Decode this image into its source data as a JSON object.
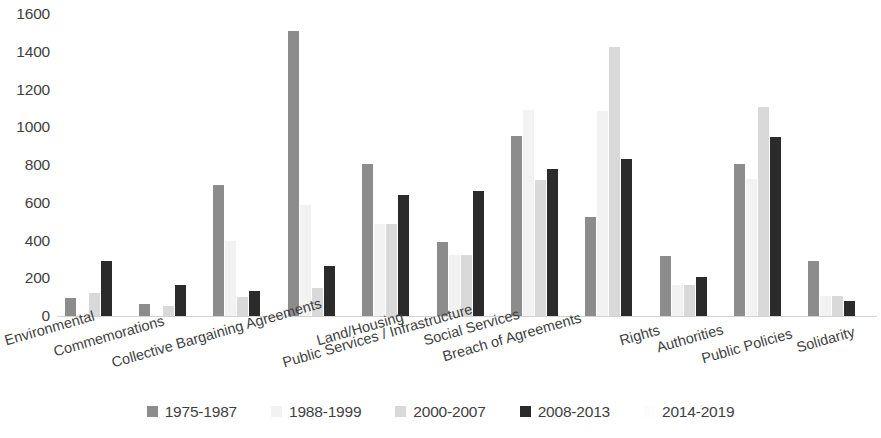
{
  "chart_data": {
    "type": "bar",
    "title": "",
    "subtitle": "",
    "xlabel": "",
    "ylabel": "",
    "ylim": [
      0,
      1600
    ],
    "y_ticks": [
      0,
      200,
      400,
      600,
      800,
      1000,
      1200,
      1400,
      1600
    ],
    "grid": false,
    "legend_position": "bottom",
    "categories": [
      "Environmental",
      "Commemorations",
      "Collective Bargaining Agreements",
      "Land/Housing",
      "Public Services / Infrastructure",
      "Social Services",
      "Breach of Agreements",
      "Rights",
      "Authorities",
      "Public Policies",
      "Solidarity"
    ],
    "series": [
      {
        "name": "1975-1987",
        "color": "#8c8c8c",
        "values": [
          95,
          65,
          695,
          1510,
          805,
          390,
          955,
          525,
          320,
          805,
          290
        ]
      },
      {
        "name": "1988-1999",
        "color": "#f2f2f2",
        "values": [
          0,
          0,
          400,
          590,
          490,
          325,
          1090,
          1085,
          165,
          725,
          105
        ]
      },
      {
        "name": "2000-2007",
        "color": "#d9d9d9",
        "values": [
          120,
          55,
          100,
          150,
          490,
          325,
          720,
          1425,
          165,
          1110,
          105
        ]
      },
      {
        "name": "2008-2013",
        "color": "#2b2b2b",
        "values": [
          290,
          165,
          130,
          265,
          640,
          660,
          780,
          830,
          205,
          950,
          80
        ]
      },
      {
        "name": "2014-2019",
        "color": "#fafafa",
        "values": [
          0,
          0,
          0,
          0,
          0,
          0,
          0,
          0,
          0,
          0,
          0
        ]
      }
    ]
  },
  "axis": {
    "baseline_color": "#d2d2d2",
    "text_color": "#3f3f3f"
  },
  "legend": {
    "items": [
      {
        "label": "1975-1987",
        "color": "#8c8c8c"
      },
      {
        "label": "1988-1999",
        "color": "#f2f2f2"
      },
      {
        "label": "2000-2007",
        "color": "#d9d9d9"
      },
      {
        "label": "2008-2013",
        "color": "#2b2b2b"
      },
      {
        "label": "2014-2019",
        "color": "#fcfcfc"
      }
    ]
  }
}
